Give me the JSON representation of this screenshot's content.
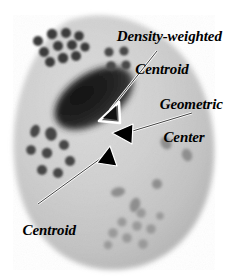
{
  "figure": {
    "width": 231,
    "height": 278,
    "background_color": "#ffffff"
  },
  "labels": {
    "density_weighted_centroid": {
      "line1": "Density-weighted",
      "line2": "Centroid"
    },
    "geometric_center": {
      "line1": "Geometric",
      "line2": "Center"
    },
    "centroid": {
      "line1": "Centroid"
    }
  },
  "annotations": [
    {
      "name": "density-weighted-centroid-pointer",
      "label": "Density-weighted Centroid",
      "arrowhead_style": "hollow",
      "arrowhead_fill": "#6b6b6b",
      "arrowhead_stroke": "#ffffff",
      "point_x": 101,
      "point_y": 118,
      "leader_from_x": 158,
      "leader_from_y": 52
    },
    {
      "name": "geometric-center-pointer",
      "label": "Geometric Center",
      "arrowhead_style": "solid",
      "arrowhead_fill": "#000000",
      "arrowhead_stroke": "#ffffff",
      "point_x": 114,
      "point_y": 133,
      "leader_from_x": 190,
      "leader_from_y": 113
    },
    {
      "name": "centroid-pointer",
      "label": "Centroid",
      "arrowhead_style": "solid",
      "arrowhead_fill": "#000000",
      "arrowhead_stroke": "#ffffff",
      "point_x": 110,
      "point_y": 147,
      "leader_from_x": 40,
      "leader_from_y": 203
    }
  ],
  "cell": {
    "name": "cell-body",
    "fill_light": "#d2d2d2",
    "fill_mid": "#c2c2c2",
    "fill_dark": "#b4b4b4",
    "edge": "soft-blurred"
  },
  "nucleus": {
    "name": "nucleus",
    "fill_dark": "#1c1c1c",
    "fill_mid": "#3a3a3a",
    "center_x": 94,
    "center_y": 98,
    "radius_x": 42,
    "radius_y": 25,
    "rotation_deg": -33
  },
  "granule_clusters": [
    {
      "name": "upper-left-cluster",
      "tone": "dark",
      "color": "#3c3c3c",
      "count": 11
    },
    {
      "name": "upper-right-cluster",
      "tone": "dark",
      "color": "#4a4a4a",
      "count": 4
    },
    {
      "name": "left-middle-cluster",
      "tone": "dark",
      "color": "#494949",
      "count": 8
    },
    {
      "name": "right-scattered",
      "tone": "mid",
      "color": "#939393",
      "count": 4
    },
    {
      "name": "lower-right-cluster",
      "tone": "light",
      "color": "#9d9d9d",
      "count": 9
    }
  ]
}
